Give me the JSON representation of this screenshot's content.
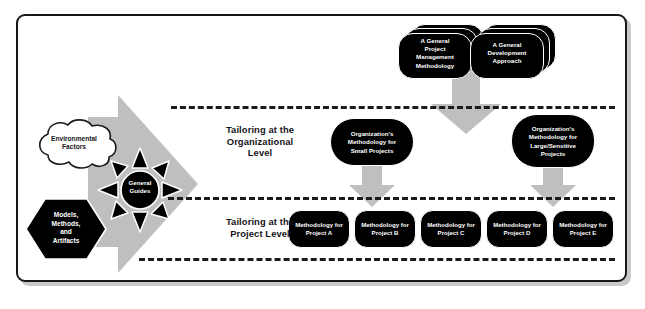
{
  "diagram": {
    "colors": {
      "frame_border": "#17171b",
      "gray_fill": "#bfbfbf",
      "gray_fill_light": "#cfcfcf",
      "black_fill": "#000000",
      "text_on_black": "#ffffff",
      "text_on_white": "#141418",
      "dashed_line": "#1b1b1f",
      "page_background": "#ffffff"
    },
    "inputs": {
      "cloud": {
        "name": "environmental-factors",
        "label": "Environmental\nFactors",
        "line1": "Environmental",
        "line2": "Factors"
      },
      "hexagon": {
        "name": "models-methods-artifacts",
        "line1": "Models,",
        "line2": "Methods,",
        "line3": "and",
        "line4": "Artifacts"
      },
      "starburst": {
        "name": "general-guides",
        "line1": "General",
        "line2": "Guides",
        "ray_count": 8
      }
    },
    "top_row": {
      "items": [
        {
          "id": "general-project-management-methodology",
          "lines": [
            "A General",
            "Project",
            "Management",
            "Methodology"
          ],
          "stack_depth": 3
        },
        {
          "id": "general-development-approach",
          "lines": [
            "A General",
            "Development",
            "Approach"
          ],
          "stack_depth": 3
        }
      ]
    },
    "bands": [
      {
        "id": "organizational",
        "label_lines": [
          "Tailoring at the",
          "Organizational",
          "Level"
        ]
      },
      {
        "id": "project",
        "label_lines": [
          "Tailoring at the",
          "Project Level"
        ]
      }
    ],
    "organizational_row": {
      "items": [
        {
          "id": "org-methodology-small-projects",
          "lines": [
            "Organization's",
            "Methodology for",
            "Small Projects"
          ]
        },
        {
          "id": "org-methodology-large-sensitive-projects",
          "lines": [
            "Organization's",
            "Methodology for",
            "Large/Sensitive",
            "Projects"
          ]
        }
      ]
    },
    "project_row": {
      "items": [
        {
          "id": "methodology-project-a",
          "line1": "Methodology for",
          "line2": "Project A"
        },
        {
          "id": "methodology-project-b",
          "line1": "Methodology for",
          "line2": "Project B"
        },
        {
          "id": "methodology-project-c",
          "line1": "Methodology for",
          "line2": "Project C"
        },
        {
          "id": "methodology-project-d",
          "line1": "Methodology for",
          "line2": "Project D"
        },
        {
          "id": "methodology-project-e",
          "line1": "Methodology for",
          "line2": "Project E"
        }
      ]
    },
    "arrows": {
      "big_left": {
        "name": "general-guides-flow-arrow",
        "direction": "right"
      },
      "top_to_org": {
        "name": "top-to-organizational-arrow",
        "direction": "down"
      },
      "org_to_proj_left": {
        "name": "small-projects-to-project-level-arrow",
        "direction": "down"
      },
      "org_to_proj_right": {
        "name": "large-sensitive-to-project-level-arrow",
        "direction": "down"
      }
    },
    "dividers": [
      {
        "id": "divider-top"
      },
      {
        "id": "divider-middle"
      },
      {
        "id": "divider-bottom"
      }
    ]
  }
}
